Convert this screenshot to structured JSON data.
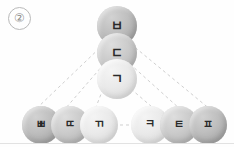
{
  "figure": {
    "marker_label": "②",
    "width": 234,
    "height": 147,
    "background_color": "#fefefe",
    "baseline_color": "#e2e2e2"
  },
  "palette": {
    "node_dark": "#a9a9a9",
    "node_mid": "#bababa",
    "node_light": "#dcdcdc",
    "edge_color": "#cfcfcf",
    "text_color": "#2a2a2a",
    "marker_color": "#8d8d8d"
  },
  "nodes": {
    "stack": [
      {
        "id": "node-b",
        "label": "ㅂ",
        "shade": "dark",
        "cx": 117,
        "cy": 26,
        "r": 20,
        "font_size": 13
      },
      {
        "id": "node-d",
        "label": "ㄷ",
        "shade": "mid",
        "cx": 117,
        "cy": 53,
        "r": 20,
        "font_size": 13
      },
      {
        "id": "node-g",
        "label": "ㄱ",
        "shade": "light",
        "cx": 117,
        "cy": 79,
        "r": 20,
        "font_size": 13
      }
    ],
    "bottom_left": [
      {
        "id": "node-bb",
        "label": "ㅃ",
        "shade": "dark",
        "cx": 41,
        "cy": 125,
        "r": 19,
        "font_size": 11
      },
      {
        "id": "node-dd",
        "label": "ㄸ",
        "shade": "mid",
        "cx": 70,
        "cy": 125,
        "r": 19,
        "font_size": 11
      },
      {
        "id": "node-gg",
        "label": "ㄲ",
        "shade": "light",
        "cx": 99,
        "cy": 125,
        "r": 19,
        "font_size": 11
      }
    ],
    "bottom_right": [
      {
        "id": "node-k",
        "label": "ㅋ",
        "shade": "light",
        "cx": 150,
        "cy": 125,
        "r": 19,
        "font_size": 11
      },
      {
        "id": "node-t",
        "label": "ㅌ",
        "shade": "mid",
        "cx": 179,
        "cy": 125,
        "r": 19,
        "font_size": 11
      },
      {
        "id": "node-p",
        "label": "ㅍ",
        "shade": "dark",
        "cx": 208,
        "cy": 125,
        "r": 19,
        "font_size": 11
      }
    ]
  },
  "edges": [
    {
      "id": "edge-b-bb",
      "from": "node-b",
      "to": "node-bb",
      "x1": 108,
      "y1": 40,
      "x2": 35,
      "y2": 110
    },
    {
      "id": "edge-d-dd",
      "from": "node-d",
      "to": "node-dd",
      "x1": 104,
      "y1": 64,
      "x2": 65,
      "y2": 109
    },
    {
      "id": "edge-g-gg",
      "from": "node-g",
      "to": "node-gg",
      "x1": 103,
      "y1": 89,
      "x2": 96,
      "y2": 107
    },
    {
      "id": "edge-g-k",
      "from": "node-g",
      "to": "node-k",
      "x1": 131,
      "y1": 89,
      "x2": 152,
      "y2": 107
    },
    {
      "id": "edge-d-t",
      "from": "node-d",
      "to": "node-t",
      "x1": 130,
      "y1": 64,
      "x2": 180,
      "y2": 109
    },
    {
      "id": "edge-b-p",
      "from": "node-b",
      "to": "node-p",
      "x1": 126,
      "y1": 40,
      "x2": 211,
      "y2": 110
    },
    {
      "id": "edge-gg-k",
      "from": "node-gg",
      "to": "node-k",
      "x1": 120,
      "y1": 125,
      "x2": 130,
      "y2": 125
    }
  ]
}
